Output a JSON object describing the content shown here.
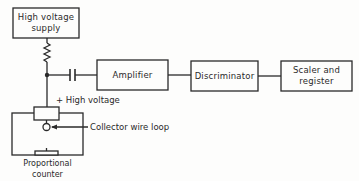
{
  "diagram": {
    "type": "block-diagram",
    "blocks": {
      "hv_supply": {
        "label_line1": "High voltage",
        "label_line2": "supply"
      },
      "amplifier": {
        "label": "Amplifier"
      },
      "discriminator": {
        "label": "Discriminator"
      },
      "scaler": {
        "label_line1": "Scaler and",
        "label_line2": "register"
      }
    },
    "annotations": {
      "high_voltage": "+ High voltage",
      "collector": "Collector wire loop",
      "counter_line1": "Proportional",
      "counter_line2": "counter"
    },
    "components": [
      "resistor",
      "capacitor",
      "junction-node"
    ],
    "colors": {
      "line": "#2a2a2a",
      "background": "#fdfdfc"
    }
  }
}
